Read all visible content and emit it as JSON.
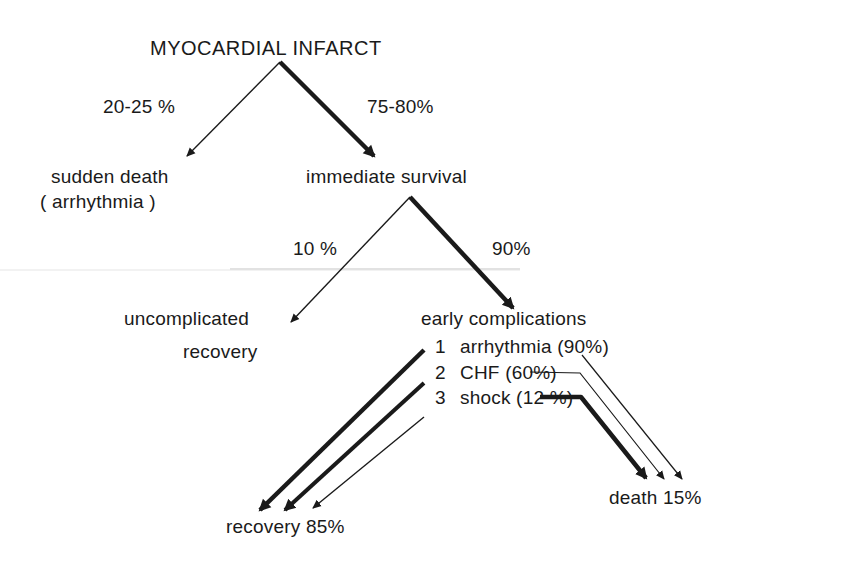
{
  "diagram": {
    "type": "flow-tree",
    "root": {
      "label": "MYOCARDIAL INFARCT"
    },
    "level1": {
      "left": {
        "label": "sudden death",
        "sublabel": "( arrhythmia )",
        "percent": "20-25 %"
      },
      "right": {
        "label": "immediate survival",
        "percent": "75-80%"
      }
    },
    "level2": {
      "left": {
        "label": "uncomplicated",
        "sublabel": "recovery",
        "percent": "10 %"
      },
      "right": {
        "label": "early complications",
        "percent": "90%"
      }
    },
    "complications": [
      {
        "num": "1",
        "label": "arrhythmia (90%)"
      },
      {
        "num": "2",
        "label": "CHF  (60%)"
      },
      {
        "num": "3",
        "label": "shock  (12 %)"
      }
    ],
    "outcomes": {
      "recovery": "recovery  85%",
      "death": "death 15%"
    },
    "colors": {
      "ink": "#1a1a1a",
      "background": "#ffffff",
      "scan_line": "#e6e6e6"
    }
  }
}
